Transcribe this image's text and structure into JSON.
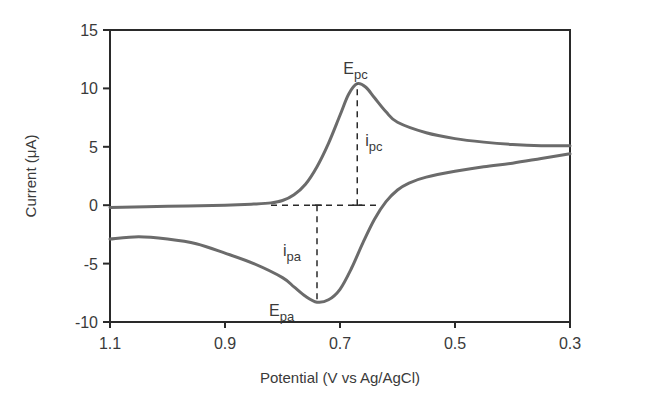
{
  "chart_data": {
    "type": "line",
    "title": "",
    "xlabel": "Potential (V vs Ag/AgCl)",
    "ylabel": "Current (μA)",
    "xlim": [
      1.1,
      0.3
    ],
    "ylim": [
      -10,
      15
    ],
    "x_reversed": true,
    "grid": false,
    "legend": null,
    "x_ticks": [
      1.1,
      0.9,
      0.7,
      0.5,
      0.3
    ],
    "x_tick_labels": [
      "1.1",
      "0.9",
      "0.7",
      "0.5",
      "0.3"
    ],
    "y_ticks": [
      15,
      10,
      5,
      0,
      -5,
      -10
    ],
    "y_tick_labels": [
      "15",
      "10",
      "5",
      "0",
      "-5",
      "-10"
    ],
    "series": [
      {
        "name": "Cathodic sweep (forward)",
        "x": [
          1.1,
          1.0,
          0.9,
          0.85,
          0.82,
          0.8,
          0.78,
          0.76,
          0.74,
          0.72,
          0.7,
          0.685,
          0.67,
          0.655,
          0.64,
          0.62,
          0.6,
          0.55,
          0.5,
          0.45,
          0.4,
          0.35,
          0.3
        ],
        "y": [
          -0.2,
          -0.1,
          0.0,
          0.1,
          0.2,
          0.4,
          0.9,
          1.8,
          3.3,
          5.3,
          7.7,
          9.5,
          10.4,
          10.1,
          9.2,
          8.0,
          7.1,
          6.2,
          5.7,
          5.4,
          5.2,
          5.1,
          5.1
        ]
      },
      {
        "name": "Anodic sweep (reverse)",
        "x": [
          0.3,
          0.35,
          0.4,
          0.45,
          0.5,
          0.55,
          0.58,
          0.6,
          0.62,
          0.64,
          0.66,
          0.68,
          0.7,
          0.72,
          0.74,
          0.76,
          0.78,
          0.8,
          0.85,
          0.9,
          0.95,
          1.0,
          1.05,
          1.1
        ],
        "y": [
          4.4,
          4.0,
          3.6,
          3.3,
          2.9,
          2.4,
          1.9,
          1.3,
          0.3,
          -1.2,
          -3.2,
          -5.4,
          -7.2,
          -8.1,
          -8.3,
          -7.8,
          -7.0,
          -6.2,
          -5.0,
          -4.1,
          -3.3,
          -2.9,
          -2.7,
          -2.9
        ]
      }
    ],
    "annotations": [
      {
        "label": "E",
        "sub": "pc",
        "x": 0.67,
        "y": 10.4,
        "description": "cathodic peak potential"
      },
      {
        "label": "i",
        "sub": "pc",
        "x": 0.67,
        "y_from": 0.0,
        "y_to": 10.4,
        "description": "cathodic peak current (dashed vertical)"
      },
      {
        "label": "E",
        "sub": "pa",
        "x": 0.74,
        "y": -8.3,
        "description": "anodic peak potential"
      },
      {
        "label": "i",
        "sub": "pa",
        "x": 0.74,
        "y_from": 0.0,
        "y_to": -8.3,
        "description": "anodic peak current (dashed vertical)"
      },
      {
        "label": "baseline",
        "x_from": 0.82,
        "x_to": 0.63,
        "y": 0.0,
        "description": "dashed baseline at 0 μA"
      }
    ],
    "colors": {
      "curve": "#6b6b6b",
      "axis": "#2a2a2a",
      "dashed": "#2a2a2a",
      "text": "#3a3a3a"
    }
  }
}
